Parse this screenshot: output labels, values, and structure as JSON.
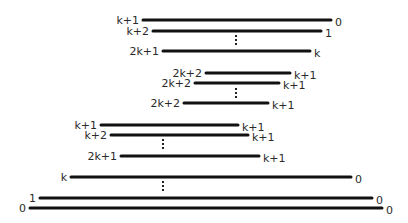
{
  "diagram": {
    "groups": [
      {
        "name": "group-1",
        "segments": [
          {
            "left": "k+1",
            "right": "0"
          },
          {
            "left": "k+2",
            "right": "1"
          },
          {
            "left": "2k+1",
            "right": "k"
          }
        ],
        "ellipsis_after": 1
      },
      {
        "name": "group-2",
        "segments": [
          {
            "left": "2k+2",
            "right": "k+1"
          },
          {
            "left": "2k+2",
            "right": "k+1"
          },
          {
            "left": "2k+2",
            "right": "k+1"
          }
        ],
        "ellipsis_after": 1
      },
      {
        "name": "group-3",
        "segments": [
          {
            "left": "k+1",
            "right": "k+1"
          },
          {
            "left": "k+2",
            "right": "k+1"
          },
          {
            "left": "2k+1",
            "right": "k+1"
          }
        ],
        "ellipsis_after": 1
      },
      {
        "name": "group-4",
        "segments": [
          {
            "left": "k",
            "right": "0"
          },
          {
            "left": "1",
            "right": "0"
          },
          {
            "left": "0",
            "right": "0"
          }
        ],
        "ellipsis_after": 0
      }
    ],
    "ellipsis_symbol": "⋮"
  }
}
